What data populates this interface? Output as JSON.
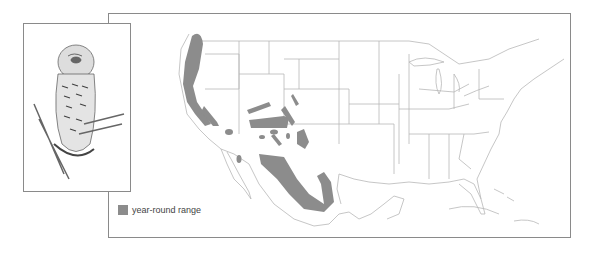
{
  "figure": {
    "illustration": {
      "icon": "owl-illustration"
    },
    "map": {
      "region": "North America (United States, Mexico, southern Canada)",
      "colors": {
        "range": "#8c8c8c",
        "outline": "#b5b5b5",
        "frame": "#8a8a8a"
      }
    },
    "legend": {
      "items": [
        {
          "label": "year-round range",
          "color": "#8c8c8c"
        }
      ]
    }
  }
}
